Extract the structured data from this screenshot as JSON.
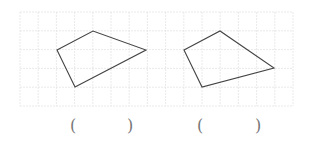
{
  "grid": {
    "x0": 20,
    "y0": 12,
    "cols": 15,
    "rows": 5,
    "cell_w": 18.2,
    "cell_h": 18.8,
    "line_color": "#e4e4e4"
  },
  "shapes": [
    {
      "name": "quadrilateral-1",
      "points": "57,50 93,31 146,50 75,87",
      "stroke": "#444444"
    },
    {
      "name": "quadrilateral-2",
      "points": "184,50 220,31 274,68 202,87",
      "stroke": "#444444"
    }
  ],
  "answers": [
    {
      "open": "(",
      "close": ")",
      "open_x": 70,
      "close_x": 127
    },
    {
      "open": "(",
      "close": ")",
      "open_x": 197,
      "close_x": 255
    }
  ]
}
